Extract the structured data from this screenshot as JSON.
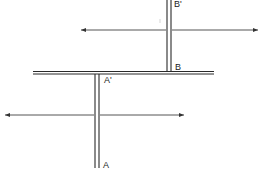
{
  "diagram": {
    "type": "schematic",
    "labels": {
      "b_prime": "B'",
      "b": "B",
      "a_prime": "A'",
      "a": "A"
    },
    "colors": {
      "line": "#2a2a2a",
      "arrow": "#555555",
      "background": "#ffffff"
    },
    "elements": {
      "horizontal_bar": {
        "x1": 33,
        "x2": 214,
        "y": 72.5
      },
      "upper_vertical": {
        "x_left": 167,
        "x_right": 171,
        "y_top": 0,
        "y_bottom": 72
      },
      "lower_vertical": {
        "x_left": 95,
        "x_right": 99,
        "y_top": 74,
        "y_bottom": 168
      },
      "upper_arrow": {
        "x1": 80,
        "x2": 259,
        "y": 30,
        "double_headed": true
      },
      "lower_arrow": {
        "x1": 4,
        "x2": 185,
        "y": 115,
        "double_headed": true
      }
    }
  }
}
